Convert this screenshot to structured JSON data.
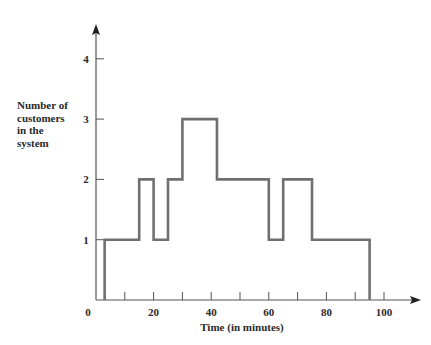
{
  "chart_data": {
    "type": "line",
    "subtype": "step",
    "title": "",
    "xlabel": "Time (in minutes)",
    "ylabel": "Number of customers in the system",
    "ylabel_lines": [
      "Number of",
      "customers",
      "in the",
      "system"
    ],
    "xlim": [
      0,
      110
    ],
    "ylim": [
      0,
      4.5
    ],
    "x_ticks": [
      0,
      10,
      20,
      30,
      40,
      50,
      60,
      70,
      80,
      90,
      100
    ],
    "x_tick_labels": [
      "0",
      "20",
      "40",
      "60",
      "80",
      "100"
    ],
    "x_tick_label_values": [
      0,
      20,
      40,
      60,
      80,
      100
    ],
    "y_ticks": [
      1,
      2,
      3,
      4
    ],
    "y_tick_labels": [
      "1",
      "2",
      "3",
      "4"
    ],
    "grid": false,
    "legend": null,
    "series": [
      {
        "name": "Number of customers",
        "color": "#707070",
        "steps": [
          {
            "start": 0,
            "end": 3,
            "value": 0
          },
          {
            "start": 3,
            "end": 15,
            "value": 1
          },
          {
            "start": 15,
            "end": 20,
            "value": 2
          },
          {
            "start": 20,
            "end": 25,
            "value": 1
          },
          {
            "start": 25,
            "end": 30,
            "value": 2
          },
          {
            "start": 30,
            "end": 42,
            "value": 3
          },
          {
            "start": 42,
            "end": 60,
            "value": 2
          },
          {
            "start": 60,
            "end": 65,
            "value": 1
          },
          {
            "start": 65,
            "end": 75,
            "value": 2
          },
          {
            "start": 75,
            "end": 95,
            "value": 1
          },
          {
            "start": 95,
            "end": 95,
            "value": 0
          }
        ]
      }
    ]
  },
  "labels": {
    "ylabel_text": "Number of\ncustomers\nin the\nsystem",
    "xlabel_text": "Time (in minutes)"
  },
  "colors": {
    "axis": "#555555",
    "line": "#707070",
    "text": "#2a2a2a"
  }
}
